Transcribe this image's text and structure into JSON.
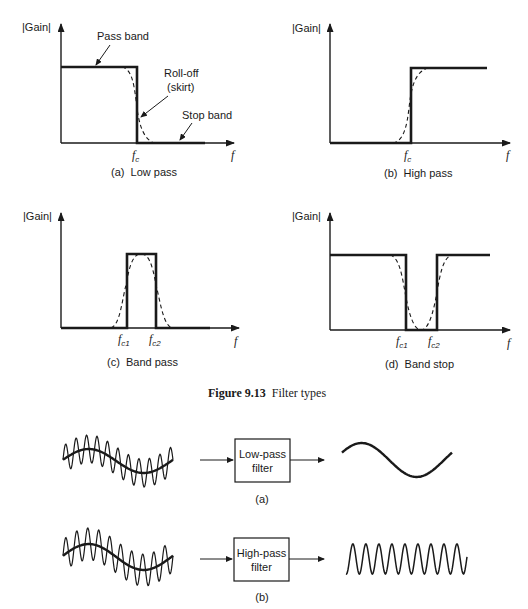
{
  "figure": {
    "number": "Figure 9.13",
    "title": "Filter types"
  },
  "panels": {
    "a": {
      "ylabel": "|Gain|",
      "xlabel": "f",
      "cutoff": "f",
      "cutoff_sub": "c",
      "caption": "(a)  Low pass",
      "annotations": {
        "pass_band": "Pass band",
        "rolloff": "Roll-off",
        "skirt": "(skirt)",
        "stop_band": "Stop band"
      }
    },
    "b": {
      "ylabel": "|Gain|",
      "xlabel": "f",
      "cutoff": "f",
      "cutoff_sub": "c",
      "caption": "(b)  High pass"
    },
    "c": {
      "ylabel": "|Gain|",
      "xlabel": "f",
      "cutoff1": "f",
      "cutoff1_sub": "c1",
      "cutoff2": "f",
      "cutoff2_sub": "c2",
      "caption": "(c)  Band pass"
    },
    "d": {
      "ylabel": "|Gain|",
      "xlabel": "f",
      "cutoff1": "f",
      "cutoff1_sub": "c1",
      "cutoff2": "f",
      "cutoff2_sub": "c2",
      "caption": "(d)  Band stop"
    }
  },
  "signal_diagrams": {
    "a": {
      "filter_line1": "Low-pass",
      "filter_line2": "filter",
      "caption": "(a)",
      "input": "low-frequency sine with superimposed high-frequency component",
      "output": "low-frequency sine"
    },
    "b": {
      "filter_line1": "High-pass",
      "filter_line2": "filter",
      "caption": "(b)",
      "input": "low-frequency sine with superimposed high-frequency component",
      "output": "high-frequency sine"
    }
  },
  "colors": {
    "ink": "#1a1a1a",
    "background": "#ffffff"
  }
}
